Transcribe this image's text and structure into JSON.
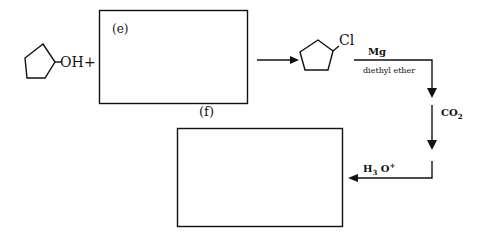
{
  "diagram": {
    "reactant": {
      "name": "cyclopentanol",
      "substituent": "OH"
    },
    "plus": "+",
    "box_e": {
      "label": "(e)"
    },
    "box_f": {
      "label": "(f)"
    },
    "intermediate": {
      "name": "chlorocyclopentane",
      "substituent": "Cl"
    },
    "step1": {
      "reagent": "Mg",
      "solvent": "diethyl ether"
    },
    "step2": {
      "reagent": "CO",
      "subscript": "2"
    },
    "step3": {
      "reagent_h": "H",
      "subscript": "3",
      "reagent_o": "O",
      "superscript": "+"
    },
    "colors": {
      "line": "#111111",
      "background": "#ffffff"
    }
  }
}
